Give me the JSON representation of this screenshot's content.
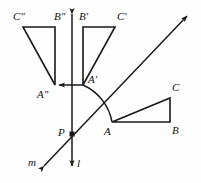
{
  "figure": {
    "background_color": "#fefefe",
    "stroke_color": "#1a1a1a",
    "label_color": "#111111"
  },
  "labels": {
    "c_double_prime": "C″",
    "b_double_prime": "B″",
    "b_prime": "B′",
    "c_prime": "C′",
    "a_double_prime": "A″",
    "a_prime": "A′",
    "c": "C",
    "a": "A",
    "b": "B",
    "p": "P",
    "m": "m",
    "l": "l"
  },
  "points": {
    "A": {
      "x": 112,
      "y": 122
    },
    "B": {
      "x": 170,
      "y": 122
    },
    "C": {
      "x": 170,
      "y": 98
    },
    "A_prime": {
      "x": 83,
      "y": 85
    },
    "B_prime": {
      "x": 83,
      "y": 27
    },
    "C_prime": {
      "x": 115,
      "y": 27
    },
    "A_double_prime": {
      "x": 55,
      "y": 85
    },
    "B_double_prime": {
      "x": 55,
      "y": 27
    },
    "C_double_prime": {
      "x": 23,
      "y": 27
    },
    "P": {
      "x": 72,
      "y": 134
    }
  },
  "lines": {
    "l": {
      "name": "vertical line l",
      "from": {
        "x": 72,
        "y": 10
      },
      "to": {
        "x": 72,
        "y": 170
      },
      "arrow_top": true,
      "arrow_bottom": true
    },
    "m": {
      "name": "oblique line m",
      "from": {
        "x": 41,
        "y": 169
      },
      "to": {
        "x": 190,
        "y": 13
      },
      "arrow_start": true,
      "arrow_end": true
    }
  },
  "arcs": {
    "rotation_arc": {
      "name": "arc from A to A-prime",
      "from": {
        "x": 112,
        "y": 122
      },
      "to": {
        "x": 83,
        "y": 85
      },
      "radius": 50
    },
    "reflection_arrow": {
      "name": "arrow from A-prime to A-double-prime",
      "from": {
        "x": 83,
        "y": 85
      },
      "to": {
        "x": 56,
        "y": 85
      }
    }
  },
  "triangles": [
    {
      "id": "original",
      "vertices": [
        "A",
        "B",
        "C"
      ],
      "description": "original right triangle ABC"
    },
    {
      "id": "first-image",
      "vertices": [
        "A_prime",
        "B_prime",
        "C_prime"
      ],
      "description": "first reflected image A'B'C'"
    },
    {
      "id": "second-image",
      "vertices": [
        "A_double_prime",
        "B_double_prime",
        "C_double_prime"
      ],
      "description": "second reflected image A''B''C''"
    }
  ],
  "label_positions": {
    "c_double_prime": {
      "left": 13,
      "top": 11
    },
    "b_double_prime": {
      "left": 54,
      "top": 11
    },
    "b_prime": {
      "left": 78,
      "top": 11
    },
    "c_prime": {
      "left": 116,
      "top": 11
    },
    "a_double_prime": {
      "left": 37,
      "top": 88
    },
    "a_prime": {
      "left": 88,
      "top": 74
    },
    "c": {
      "left": 172,
      "top": 82
    },
    "a": {
      "left": 104,
      "top": 125
    },
    "b": {
      "left": 172,
      "top": 124
    },
    "p": {
      "left": 58,
      "top": 127
    },
    "m": {
      "left": 28,
      "top": 156
    },
    "l": {
      "left": 77,
      "top": 158
    }
  }
}
